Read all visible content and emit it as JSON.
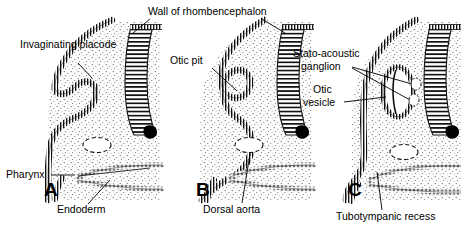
{
  "figure": {
    "background_color": "#ffffff",
    "ink_color": "#000000",
    "mesenchyme_fill": "#fbfbfb"
  },
  "shared_labels": {
    "wall_of_rhombencephalon": "Wall of rhombencephalon"
  },
  "panels": [
    {
      "letter": "A",
      "stage": "invaginating placode",
      "labels": {
        "invaginating_placode": "Invaginating placode",
        "pharynx": "Pharynx",
        "endoderm": "Endoderm"
      }
    },
    {
      "letter": "B",
      "stage": "otic pit",
      "labels": {
        "otic_pit": "Otic pit",
        "dorsal_aorta": "Dorsal aorta"
      }
    },
    {
      "letter": "C",
      "stage": "otic vesicle",
      "labels": {
        "stato_acoustic_ganglion": "Stato-acoustic ganglion",
        "otic_vesicle": "Otic vesicle",
        "tubotympanic_recess": "Tubotympanic recess"
      }
    }
  ]
}
